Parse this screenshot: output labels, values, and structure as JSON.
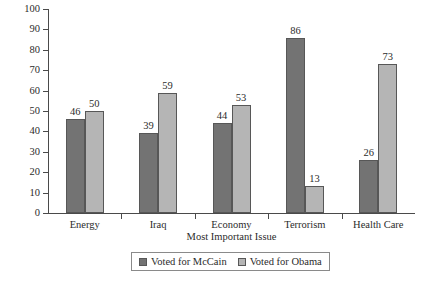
{
  "chart_data": {
    "type": "bar",
    "title": "",
    "xlabel": "Most Important Issue",
    "ylabel": "Percent Voting for Candidates",
    "categories": [
      "Energy",
      "Iraq",
      "Economy",
      "Terrorism",
      "Health Care"
    ],
    "series": [
      {
        "name": "Voted for McCain",
        "color": "#737373",
        "values": [
          46,
          39,
          44,
          86,
          26
        ]
      },
      {
        "name": "Voted for Obama",
        "color": "#b5b5b5",
        "values": [
          50,
          59,
          53,
          13,
          73
        ]
      }
    ],
    "ylim": [
      0,
      100
    ],
    "y_ticks": [
      0,
      10,
      20,
      30,
      40,
      50,
      60,
      70,
      80,
      90,
      100
    ],
    "y_tick_labels": [
      "0",
      "10",
      "20",
      "30",
      "40",
      "50",
      "60",
      "70",
      "80",
      "90",
      "100"
    ],
    "grid": false,
    "legend_position": "bottom",
    "data_labels": true
  },
  "legend": {
    "entries": [
      {
        "label": "Voted for McCain",
        "swatch": "mccain"
      },
      {
        "label": "Voted for Obama",
        "swatch": "obama"
      }
    ]
  }
}
